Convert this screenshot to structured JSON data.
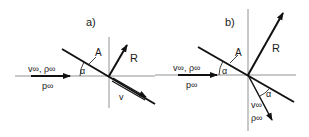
{
  "panels": [
    {
      "id": "a",
      "label": "a)",
      "plate_label": "A",
      "angle_label": "α",
      "force_label": "R",
      "freestream_top": "v∞, ρ∞",
      "freestream_bottom": "p∞",
      "velocity_label": "v"
    },
    {
      "id": "b",
      "label": "b)",
      "plate_label": "A",
      "angle_label": "α",
      "angle_label_2": "α",
      "force_label": "R",
      "freestream_top": "v∞, ρ∞",
      "freestream_bottom": "p∞",
      "velocity_label": "v∞",
      "density_label": "ρ∞"
    }
  ],
  "colors": {
    "line": "#111111",
    "axis": "#777777"
  }
}
